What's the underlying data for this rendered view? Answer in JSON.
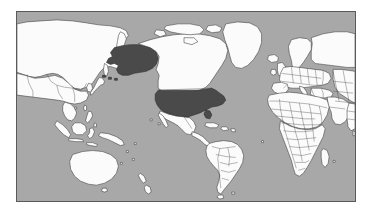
{
  "figure": {
    "canvas_width": 371,
    "canvas_height": 215
  },
  "map": {
    "projection": "mercator",
    "center_longitude": -150,
    "frame": {
      "x": 16,
      "y": 11,
      "width": 340,
      "height": 191
    },
    "colors": {
      "page_background": "#ffffff",
      "ocean": "#a8a8a8",
      "land": "#fbfbfb",
      "land_border": "#3a3a3a",
      "highlight": "#4a4a4a",
      "highlight_border": "#2b2b2b",
      "frame_border": "#5a5a5a"
    },
    "highlighted_regions": [
      {
        "name": "United States (contiguous)",
        "color": "#4a4a4a"
      },
      {
        "name": "Alaska",
        "color": "#4a4a4a"
      }
    ],
    "landmasses": [
      "Russia",
      "China",
      "Mongolia",
      "Japan",
      "Korea",
      "Southeast Asia",
      "Indonesia",
      "Philippines",
      "Papua New Guinea",
      "Australia",
      "New Zealand",
      "Alaska",
      "Canada",
      "United States",
      "Greenland",
      "Mexico",
      "Central America",
      "Caribbean",
      "South America",
      "Iceland",
      "Europe",
      "Scandinavia",
      "Africa",
      "Middle East",
      "India",
      "Central Asia"
    ]
  }
}
